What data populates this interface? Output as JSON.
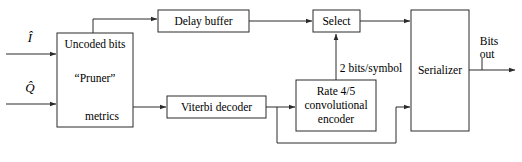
{
  "diagram": {
    "stroke_color": "#2b2b2b",
    "background_color": "#ffffff",
    "blocks": [
      {
        "id": "pruner",
        "name": "pruner-block",
        "lines": [
          "Uncoded bits",
          "“Pruner”",
          "metrics"
        ],
        "line1": "Uncoded bits",
        "line2": "“Pruner”",
        "line3": "metrics"
      },
      {
        "id": "delay_buffer",
        "name": "delay-buffer-block",
        "label": "Delay buffer"
      },
      {
        "id": "select",
        "name": "select-block",
        "label": "Select"
      },
      {
        "id": "viterbi",
        "name": "viterbi-decoder-block",
        "label": "Viterbi decoder"
      },
      {
        "id": "encoder",
        "name": "convolutional-encoder-block",
        "line1": "Rate 4/5",
        "line2": "convolutional",
        "line3": "encoder"
      },
      {
        "id": "serializer",
        "name": "serializer-block",
        "label": "Serializer"
      }
    ],
    "signals": {
      "input_i": "Î",
      "input_q": "Q̂",
      "rate_label": "2 bits/symbol",
      "output_line1": "Bits",
      "output_line2": "out"
    }
  }
}
